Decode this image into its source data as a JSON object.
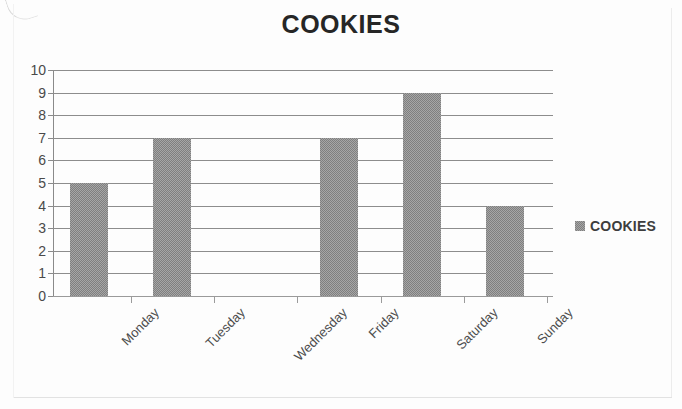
{
  "chart_data": {
    "type": "bar",
    "title": "COOKIES",
    "xlabel": "",
    "ylabel": "",
    "categories": [
      "Monday",
      "Tuesday",
      "Wednesday",
      "Friday",
      "Saturday",
      "Sunday"
    ],
    "values": [
      5,
      7,
      0,
      7,
      9,
      4
    ],
    "series": [
      {
        "name": "COOKIES",
        "values": [
          5,
          7,
          0,
          7,
          9,
          4
        ]
      }
    ],
    "ylim": [
      0,
      10
    ],
    "y_ticks": [
      10,
      9,
      8,
      7,
      6,
      5,
      4,
      3,
      2,
      1,
      0
    ],
    "grid": true,
    "legend": {
      "position": "right",
      "entries": [
        "COOKIES"
      ]
    },
    "colors": {
      "bar": "#7f7f7f",
      "gridline": "#8d8d8d",
      "axis": "#8a8a8a",
      "title_text": "#262626",
      "tick_text": "#4a4a4a",
      "background": "#fdfdfd"
    }
  }
}
